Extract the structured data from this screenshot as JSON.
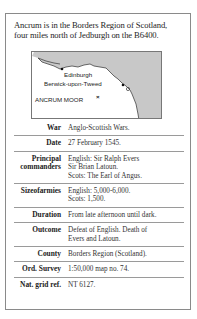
{
  "intro": {
    "line1": "Ancrum is in the Borders Region of Scotland,",
    "line2": "four miles north of Jedburgh on the B6400."
  },
  "map": {
    "land_color": "#ffffff",
    "sea_color": "#c8c8c8",
    "labels": {
      "edinburgh": "Edinburgh",
      "berwick": "Berwick-upon-Tweed",
      "ancrum": "ANCRUM MOOR",
      "ancrum_marker": "×"
    }
  },
  "facts": [
    {
      "label": "War",
      "lines": [
        "Anglo-Scottish Wars."
      ]
    },
    {
      "label": "Date",
      "lines": [
        "27 February 1545."
      ]
    },
    {
      "label_lines": [
        "Principal",
        "commanders"
      ],
      "lines": [
        "English: Sir Ralph Evers",
        "Sir Brian Latoun.",
        "Scots: The Earl of Angus."
      ]
    },
    {
      "label": "Sizeofarmies",
      "lines": [
        "English: 5,000-6,000.",
        "Scots: 1,500."
      ]
    },
    {
      "label": "Duration",
      "lines": [
        "From late afternoon until dark."
      ]
    },
    {
      "label": "Outcome",
      "lines": [
        "Defeat of English. Death of",
        "Evers and Latoun."
      ]
    },
    {
      "label": "County",
      "lines": [
        "Borders Region (Scotland)."
      ]
    },
    {
      "label": "Ord. Survey",
      "lines": [
        "1:50,000 map no. 74."
      ]
    },
    {
      "label": "Nat. grid ref.",
      "lines": [
        "NT 6127."
      ]
    }
  ]
}
